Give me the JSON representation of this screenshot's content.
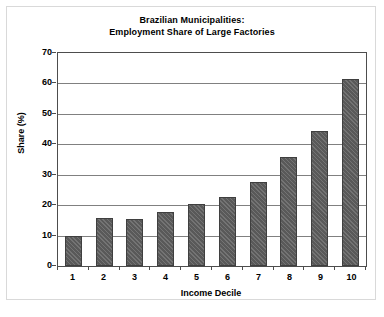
{
  "chart_data": {
    "type": "bar",
    "title": "Brazilian Municipalities: Employment Share of Large Factories",
    "title_lines": [
      "Brazilian Municipalities:",
      "Employment Share of Large Factories"
    ],
    "xlabel": "Income Decile",
    "ylabel": "Share (%)",
    "categories": [
      "1",
      "2",
      "3",
      "4",
      "5",
      "6",
      "7",
      "8",
      "9",
      "10"
    ],
    "values": [
      10.0,
      15.8,
      15.5,
      17.8,
      20.5,
      22.8,
      27.5,
      35.8,
      44.5,
      61.5
    ],
    "ylim": [
      0,
      70
    ],
    "yticks": [
      0,
      10,
      20,
      30,
      40,
      50,
      60,
      70
    ],
    "ytick_labels": [
      "0",
      "10",
      "20",
      "30",
      "40",
      "50",
      "60",
      "70"
    ],
    "grid": true,
    "legend": null,
    "bar_color": "#595959",
    "bar_edge_color": "#3f3f3f",
    "axis_color": "#4d4d4d",
    "grid_color": "#808080",
    "background_color": "#ffffff"
  }
}
